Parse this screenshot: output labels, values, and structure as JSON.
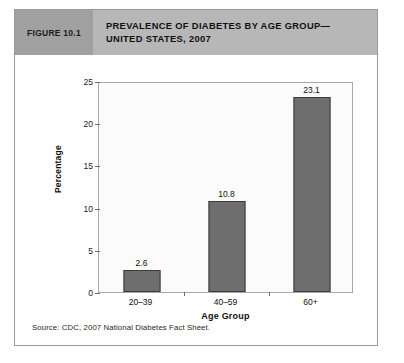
{
  "figure": {
    "number_label": "FIGURE 10.1",
    "title_line1": "PREVALENCE OF DIABETES BY AGE GROUP—",
    "title_line2": "UNITED STATES, 2007",
    "source": "Source: CDC, 2007 National Diabetes Fact Sheet."
  },
  "colors": {
    "figure_number_block": "#a0a0a0",
    "header_band": "#b7b7b7",
    "bar_fill": "#6e6e6e",
    "bar_border": "#3b3b3b",
    "plot_background": "#fbfbfb",
    "plot_border": "#a8a8a8",
    "card_border": "#9a9a9a"
  },
  "chart_data": {
    "type": "bar",
    "categories": [
      "20–39",
      "40–59",
      "60+"
    ],
    "values": [
      2.6,
      10.8,
      23.1
    ],
    "data_labels": [
      "2.6",
      "10.8",
      "23.1"
    ],
    "xlabel": "Age Group",
    "ylabel": "Percentage",
    "ylim": [
      0,
      25
    ],
    "yticks": [
      0,
      5,
      10,
      15,
      20,
      25
    ],
    "ytick_labels": [
      "0",
      "5",
      "10",
      "15",
      "20",
      "25"
    ],
    "grid": false,
    "legend": false,
    "source": "Source: CDC, 2007 National Diabetes Fact Sheet."
  }
}
